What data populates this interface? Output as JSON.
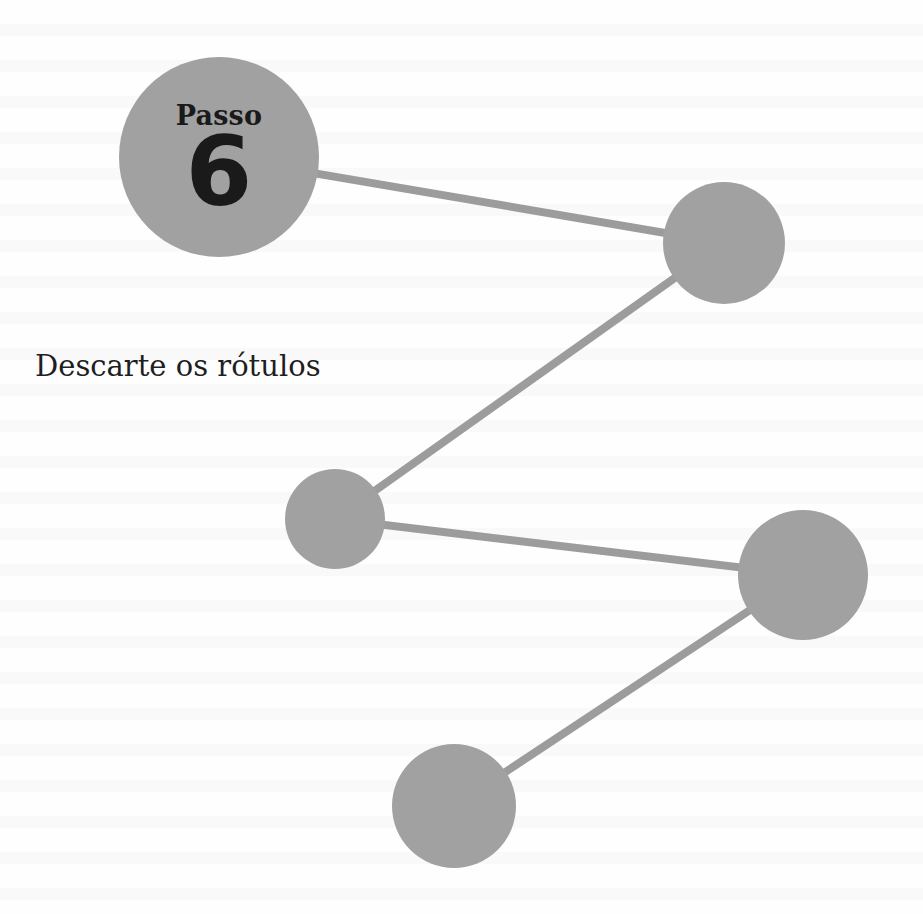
{
  "step": {
    "word": "Passo",
    "number": "6"
  },
  "title": "Descarte os rótulos",
  "colors": {
    "node_fill": "#a1a1a1",
    "connector": "#9c9c9c",
    "text": "#1a1a1a",
    "background": "#ffffff"
  },
  "nodes": [
    {
      "id": "node-1",
      "cx": 219,
      "cy": 157,
      "r": 100
    },
    {
      "id": "node-2",
      "cx": 724,
      "cy": 243,
      "r": 61
    },
    {
      "id": "node-3",
      "cx": 335,
      "cy": 519,
      "r": 50
    },
    {
      "id": "node-4",
      "cx": 803,
      "cy": 575,
      "r": 65
    },
    {
      "id": "node-5",
      "cx": 454,
      "cy": 806,
      "r": 62
    }
  ],
  "connectors": [
    {
      "from": "node-1",
      "to": "node-2"
    },
    {
      "from": "node-2",
      "to": "node-3"
    },
    {
      "from": "node-3",
      "to": "node-4"
    },
    {
      "from": "node-4",
      "to": "node-5"
    }
  ]
}
